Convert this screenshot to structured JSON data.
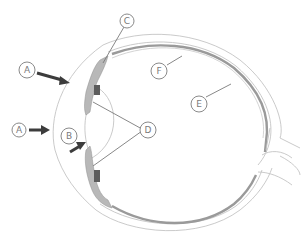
{
  "colors": {
    "background": "#ffffff",
    "outline": "#c4c4c4",
    "retina_band": "#9a9a9a",
    "iris_fill": "#b8b8b8",
    "arrow": "#3c3c3c",
    "label_stroke": "#8a8a8a",
    "label_text": "#7a7a7a"
  },
  "labels": [
    {
      "id": "A1",
      "text": "A",
      "points_to": "cornea (incoming light arrow)"
    },
    {
      "id": "A2",
      "text": "A",
      "points_to": "incoming light arrow"
    },
    {
      "id": "B",
      "text": "B",
      "points_to": "pupil / lens opening (arrow)"
    },
    {
      "id": "C",
      "text": "C",
      "points_to": "ciliary body / iris top"
    },
    {
      "id": "D",
      "text": "D",
      "points_to": "suspensory ligaments (two leaders)"
    },
    {
      "id": "E",
      "text": "E",
      "points_to": "retina"
    },
    {
      "id": "F",
      "text": "F",
      "points_to": "choroid / sclera"
    }
  ]
}
